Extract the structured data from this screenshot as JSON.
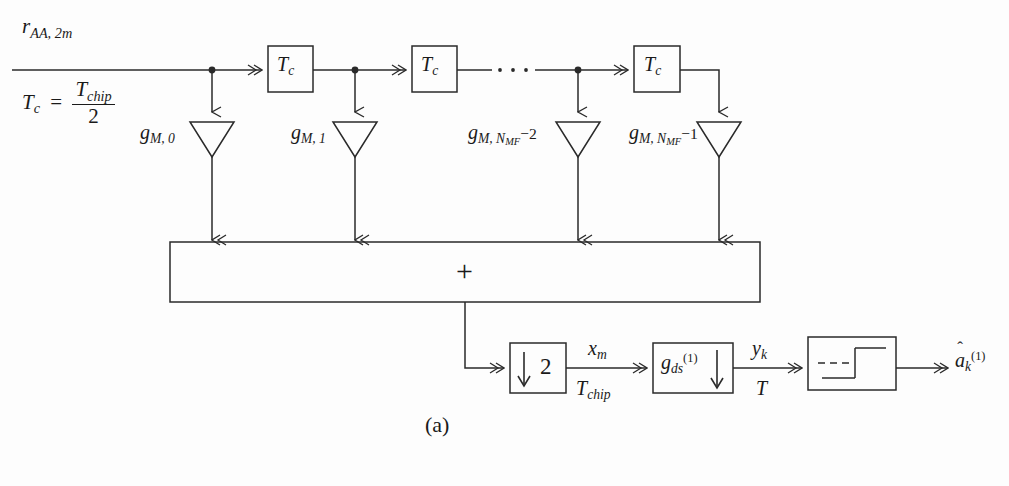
{
  "figure": {
    "caption": "(a)",
    "stroke_color": "#2a2a2a",
    "background_color": "#fdfdfd"
  },
  "input": {
    "signal_label": {
      "base": "r",
      "sub": "AA, 2m"
    },
    "rate_relation": {
      "lhs_base": "T",
      "lhs_sub": "c",
      "equals": "=",
      "numerator_base": "T",
      "numerator_sub": "chip",
      "denominator": "2"
    }
  },
  "delay_line": {
    "delay_blocks": [
      {
        "base": "T",
        "sub": "c"
      },
      {
        "base": "T",
        "sub": "c"
      },
      {
        "base": "T",
        "sub": "c"
      }
    ],
    "ellipsis": "· · ·",
    "taps": [
      {
        "base": "g",
        "sub": "M, 0"
      },
      {
        "base": "g",
        "sub": "M, 1"
      },
      {
        "base": "g",
        "sub": "M, N",
        "sub2": "MF",
        "tail": "−2"
      },
      {
        "base": "g",
        "sub": "M, N",
        "sub2": "MF",
        "tail": "−1"
      }
    ]
  },
  "summer": {
    "symbol": "+",
    "name": "summing-junction"
  },
  "downsampler": {
    "arrow": "↓",
    "factor": "2",
    "output_signal": {
      "base": "x",
      "sub": "m"
    },
    "output_rate": {
      "base": "T",
      "sub": "chip"
    }
  },
  "despreader": {
    "base": "g",
    "sub": "ds",
    "sup": "(1)",
    "arrow": "↓",
    "output_signal": {
      "base": "y",
      "sub": "k"
    },
    "output_rate": {
      "base": "T"
    }
  },
  "decision_device": {
    "name": "threshold-detector",
    "output": {
      "hat": "ˆ",
      "base": "a",
      "sub": "k",
      "sup": "(1)"
    }
  }
}
